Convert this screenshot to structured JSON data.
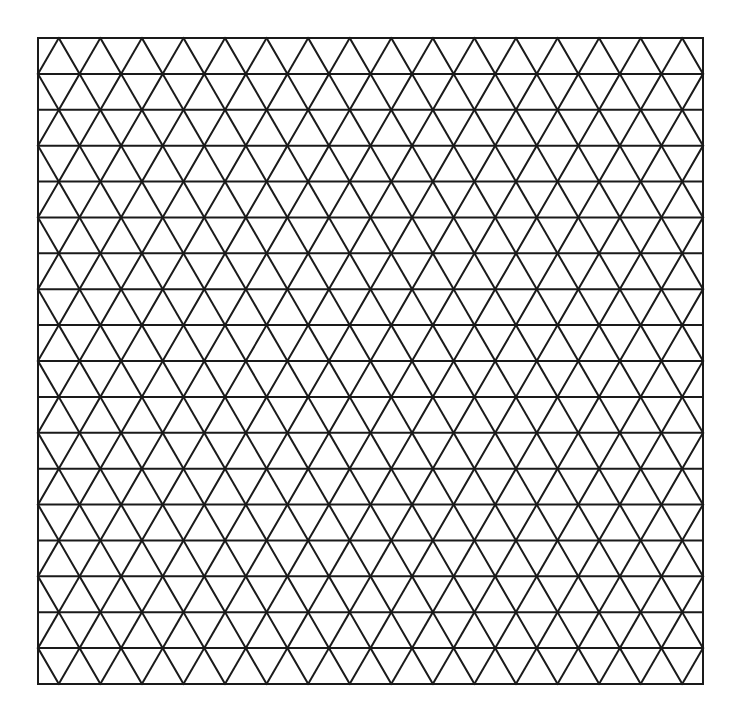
{
  "diagram": {
    "type": "triangular-grid",
    "frame": {
      "x": 38,
      "y": 38,
      "width": 665,
      "height": 646
    },
    "columns": 16,
    "rows": 18,
    "stroke_color": "#1a1a1a",
    "stroke_width": 2,
    "background": "#ffffff"
  }
}
